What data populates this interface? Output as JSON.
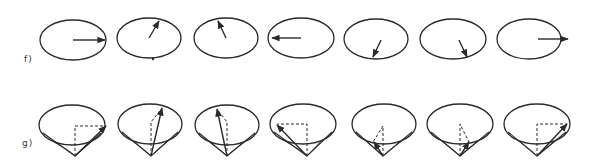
{
  "rows": {
    "f": {
      "label": "f)",
      "description": "Rotating vector seen on ellipses (top view)",
      "ellipses": [
        {
          "cx": 73,
          "cy": 40,
          "rx": 33,
          "ry": 20,
          "arrow": [
            73,
            40,
            105,
            40
          ],
          "dot": null
        },
        {
          "cx": 149,
          "cy": 38,
          "rx": 32,
          "ry": 20,
          "arrow": [
            149,
            38,
            159,
            21
          ],
          "dot": [
            153,
            59
          ]
        },
        {
          "cx": 226,
          "cy": 38,
          "rx": 32,
          "ry": 20,
          "arrow": [
            226,
            38,
            218,
            21
          ],
          "dot": null
        },
        {
          "cx": 301,
          "cy": 38,
          "rx": 33,
          "ry": 20,
          "arrow": [
            301,
            38,
            272,
            38
          ],
          "dot": null
        },
        {
          "cx": 376,
          "cy": 39,
          "rx": 32,
          "ry": 20,
          "arrow": [
            381,
            40,
            373,
            57
          ],
          "dot": null
        },
        {
          "cx": 453,
          "cy": 39,
          "rx": 33,
          "ry": 20,
          "arrow": [
            459,
            40,
            467,
            57
          ],
          "dot": null
        },
        {
          "cx": 529,
          "cy": 39,
          "rx": 32,
          "ry": 20,
          "arrow": [
            538,
            39,
            568,
            39
          ],
          "dot": null
        }
      ]
    },
    "g": {
      "label": "g)",
      "description": "Precessing vector on cones with dashed projections",
      "cones": [
        {
          "cx": 72,
          "cy": 125,
          "rx": 33,
          "ry": 20,
          "apex": [
            75,
            156
          ],
          "arrow_tip": [
            106,
            126
          ],
          "dashed": [
            [
              75,
              156
            ],
            [
              75,
              126
            ],
            [
              106,
              126
            ]
          ]
        },
        {
          "cx": 150,
          "cy": 124,
          "rx": 32,
          "ry": 20,
          "apex": [
            151,
            156
          ],
          "arrow_tip": [
            162,
            108
          ],
          "dashed": [
            [
              151,
              156
            ],
            [
              151,
              122
            ],
            [
              162,
              108
            ]
          ]
        },
        {
          "cx": 227,
          "cy": 125,
          "rx": 32,
          "ry": 20,
          "apex": [
            227,
            156
          ],
          "arrow_tip": [
            217,
            109
          ],
          "dashed": [
            [
              227,
              156
            ],
            [
              227,
              122
            ],
            [
              217,
              109
            ]
          ]
        },
        {
          "cx": 303,
          "cy": 124,
          "rx": 33,
          "ry": 20,
          "apex": [
            307,
            156
          ],
          "arrow_tip": [
            277,
            125
          ],
          "dashed": [
            [
              307,
              156
            ],
            [
              307,
              124
            ],
            [
              277,
              124
            ]
          ]
        },
        {
          "cx": 384,
          "cy": 124,
          "rx": 32,
          "ry": 20,
          "apex": [
            383,
            156
          ],
          "arrow_tip": [
            374,
            142
          ],
          "dashed": [
            [
              383,
              156
            ],
            [
              383,
              126
            ],
            [
              373,
              142
            ]
          ]
        },
        {
          "cx": 460,
          "cy": 124,
          "rx": 33,
          "ry": 20,
          "apex": [
            460,
            156
          ],
          "arrow_tip": [
            469,
            142
          ],
          "dashed": [
            [
              460,
              156
            ],
            [
              460,
              124
            ],
            [
              469,
              142
            ]
          ]
        },
        {
          "cx": 537,
          "cy": 124,
          "rx": 33,
          "ry": 20,
          "apex": [
            537,
            156
          ],
          "arrow_tip": [
            567,
            124
          ],
          "dashed": [
            [
              537,
              156
            ],
            [
              537,
              124
            ],
            [
              567,
              124
            ]
          ]
        }
      ]
    }
  },
  "colors": {
    "stroke": "#2a2a2a",
    "background": "#ffffff"
  }
}
